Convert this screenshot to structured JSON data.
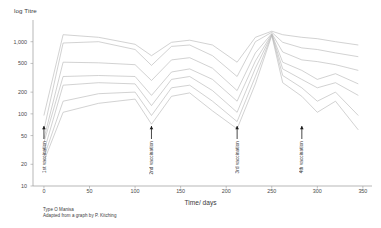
{
  "chart_data": {
    "type": "line",
    "title": "",
    "xlabel": "Time/ days",
    "ylabel": "log Titre",
    "yscale": "log",
    "ylim": [
      10,
      2000
    ],
    "xlim": [
      -12,
      360
    ],
    "grid": false,
    "legend": "none",
    "yticks": [
      1000,
      500,
      200,
      100,
      50,
      20,
      10
    ],
    "ytick_labels": [
      "1,000",
      "500",
      "200",
      "100",
      "50",
      "20",
      "10"
    ],
    "xticks": [
      0,
      50,
      100,
      150,
      200,
      250,
      300,
      350
    ],
    "xtick_labels": [
      "0",
      "50",
      "100",
      "150",
      "200",
      "250",
      "300",
      "350"
    ],
    "annotations": [
      {
        "label": "1st vaccination",
        "x": 0
      },
      {
        "label": "2nd vaccination",
        "x": 118
      },
      {
        "label": "3rd vaccination",
        "x": 212
      },
      {
        "label": "4th vaccination",
        "x": 283
      }
    ],
    "series": [
      {
        "name": "Animal 1",
        "x": [
          0,
          21,
          60,
          100,
          118,
          140,
          160,
          185,
          212,
          232,
          250,
          262,
          283,
          300,
          320,
          345
        ],
        "values": [
          95,
          1250,
          1150,
          920,
          640,
          980,
          1050,
          900,
          520,
          1150,
          1400,
          1250,
          1150,
          1100,
          1000,
          900
        ]
      },
      {
        "name": "Animal 2",
        "x": [
          0,
          21,
          60,
          100,
          118,
          140,
          160,
          185,
          212,
          232,
          250,
          262,
          283,
          300,
          320,
          345
        ],
        "values": [
          60,
          960,
          1000,
          780,
          470,
          860,
          900,
          640,
          330,
          1000,
          1350,
          980,
          820,
          780,
          700,
          620
        ]
      },
      {
        "name": "Animal 3",
        "x": [
          0,
          21,
          60,
          100,
          118,
          140,
          160,
          185,
          212,
          232,
          250,
          262,
          283,
          300,
          320,
          345
        ],
        "values": [
          45,
          520,
          510,
          480,
          290,
          560,
          600,
          430,
          210,
          700,
          1300,
          720,
          560,
          530,
          480,
          400
        ]
      },
      {
        "name": "Animal 4",
        "x": [
          0,
          21,
          60,
          100,
          118,
          140,
          160,
          185,
          212,
          232,
          250,
          262,
          283,
          300,
          320,
          345
        ],
        "values": [
          40,
          330,
          340,
          330,
          180,
          380,
          420,
          300,
          150,
          540,
          1280,
          520,
          400,
          300,
          360,
          260
        ]
      },
      {
        "name": "Animal 5",
        "x": [
          0,
          21,
          60,
          100,
          118,
          140,
          160,
          185,
          212,
          232,
          250,
          262,
          283,
          300,
          320,
          345
        ],
        "values": [
          30,
          250,
          270,
          260,
          130,
          300,
          330,
          210,
          105,
          430,
          1260,
          420,
          300,
          230,
          270,
          180
        ]
      },
      {
        "name": "Animal 6",
        "x": [
          0,
          21,
          60,
          100,
          118,
          140,
          160,
          185,
          212,
          232,
          250,
          262,
          283,
          300,
          320,
          345
        ],
        "values": [
          25,
          150,
          190,
          200,
          95,
          230,
          250,
          150,
          78,
          330,
          1240,
          340,
          230,
          150,
          200,
          95
        ]
      },
      {
        "name": "Animal 7",
        "x": [
          0,
          21,
          60,
          100,
          118,
          140,
          160,
          185,
          212,
          232,
          250,
          262,
          283,
          300,
          320,
          345
        ],
        "values": [
          22,
          105,
          140,
          160,
          72,
          175,
          195,
          110,
          62,
          260,
          1220,
          270,
          175,
          105,
          150,
          60
        ]
      }
    ]
  },
  "caption": {
    "line1": "Type O Manisa",
    "line2": "Adapted from a graph by P. Kitching"
  },
  "colors": {
    "line": "#b9b9b9",
    "axis": "#9a9a9a",
    "text": "#333333"
  }
}
